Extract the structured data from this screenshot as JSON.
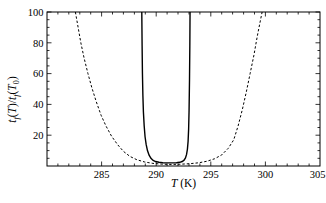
{
  "figure": {
    "width": 326,
    "height": 203,
    "background": "#ffffff",
    "frame_color": "#000000",
    "text_color": "#000000"
  },
  "chart_data": {
    "type": "line",
    "title": "",
    "xlabel": "T (K)",
    "ylabel": "t_f(T)/t_f(T_0)",
    "xlim": [
      280,
      305
    ],
    "ylim": [
      0,
      100
    ],
    "x_major_ticks": [
      285,
      290,
      295,
      300,
      305
    ],
    "x_minor_step": 1,
    "y_major_ticks": [
      20,
      40,
      60,
      80,
      100
    ],
    "y_minor_step": 5,
    "grid": false,
    "legend": "none",
    "frame": "box-with-inward-ticks",
    "series": [
      {
        "name": "narrow-solid-curve",
        "style": "solid",
        "color": "#000000",
        "stroke_width": 1.4,
        "points": [
          [
            288.68,
            100
          ],
          [
            288.71,
            78
          ],
          [
            288.74,
            60
          ],
          [
            288.78,
            46
          ],
          [
            288.83,
            35
          ],
          [
            288.9,
            26
          ],
          [
            288.98,
            19
          ],
          [
            289.08,
            14
          ],
          [
            289.2,
            10
          ],
          [
            289.35,
            7
          ],
          [
            289.52,
            5
          ],
          [
            289.72,
            3.6
          ],
          [
            289.95,
            2.9
          ],
          [
            290.25,
            2.4
          ],
          [
            290.6,
            2.1
          ],
          [
            291.0,
            2.0
          ],
          [
            291.45,
            2.0
          ],
          [
            291.85,
            2.1
          ],
          [
            292.15,
            2.4
          ],
          [
            292.38,
            2.9
          ],
          [
            292.55,
            3.8
          ],
          [
            292.68,
            5.2
          ],
          [
            292.78,
            7.5
          ],
          [
            292.86,
            11
          ],
          [
            292.92,
            16
          ],
          [
            292.97,
            24
          ],
          [
            293.01,
            36
          ],
          [
            293.05,
            56
          ],
          [
            293.08,
            78
          ],
          [
            293.1,
            100
          ]
        ]
      },
      {
        "name": "wide-dashed-curve",
        "style": "dashed",
        "color": "#000000",
        "stroke_width": 1,
        "points": [
          [
            282.6,
            100
          ],
          [
            282.85,
            90
          ],
          [
            283.1,
            80
          ],
          [
            283.4,
            70
          ],
          [
            283.75,
            60
          ],
          [
            284.1,
            51
          ],
          [
            284.5,
            42
          ],
          [
            284.95,
            33
          ],
          [
            285.4,
            26
          ],
          [
            285.9,
            19.5
          ],
          [
            286.45,
            14
          ],
          [
            287.0,
            9.5
          ],
          [
            287.6,
            6.2
          ],
          [
            288.25,
            4.0
          ],
          [
            288.95,
            2.6
          ],
          [
            289.7,
            1.7
          ],
          [
            290.5,
            1.2
          ],
          [
            291.4,
            1.0
          ],
          [
            292.3,
            1.2
          ],
          [
            293.1,
            1.5
          ],
          [
            293.9,
            2.1
          ],
          [
            294.65,
            3.1
          ],
          [
            295.35,
            4.7
          ],
          [
            296.0,
            7.2
          ],
          [
            296.6,
            11.5
          ],
          [
            297.1,
            17
          ],
          [
            297.5,
            26
          ],
          [
            297.9,
            37
          ],
          [
            298.25,
            48
          ],
          [
            298.6,
            60
          ],
          [
            298.95,
            72
          ],
          [
            299.25,
            84
          ],
          [
            299.5,
            93
          ],
          [
            299.7,
            100
          ]
        ]
      }
    ]
  }
}
